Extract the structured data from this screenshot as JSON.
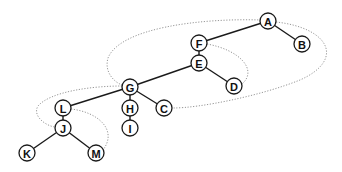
{
  "diagram": {
    "type": "tree",
    "node_radius": 8,
    "colors": {
      "edge": "#1a1a1a",
      "thread": "#8a8a8a",
      "node_fill": "#ffffff",
      "node_stroke": "#1a1a1a",
      "label": "#111111"
    },
    "nodes": [
      {
        "id": "A",
        "label": "A",
        "x": 268,
        "y": 21
      },
      {
        "id": "B",
        "label": "B",
        "x": 302,
        "y": 44
      },
      {
        "id": "F",
        "label": "F",
        "x": 199,
        "y": 43
      },
      {
        "id": "E",
        "label": "E",
        "x": 199,
        "y": 63
      },
      {
        "id": "D",
        "label": "D",
        "x": 234,
        "y": 86
      },
      {
        "id": "G",
        "label": "G",
        "x": 130,
        "y": 87
      },
      {
        "id": "H",
        "label": "H",
        "x": 130,
        "y": 108
      },
      {
        "id": "I",
        "label": "I",
        "x": 130,
        "y": 128
      },
      {
        "id": "C",
        "label": "C",
        "x": 164,
        "y": 108
      },
      {
        "id": "L",
        "label": "L",
        "x": 63,
        "y": 108
      },
      {
        "id": "J",
        "label": "J",
        "x": 63,
        "y": 128
      },
      {
        "id": "K",
        "label": "K",
        "x": 27,
        "y": 153
      },
      {
        "id": "M",
        "label": "M",
        "x": 96,
        "y": 153
      }
    ],
    "edges": [
      [
        "A",
        "F"
      ],
      [
        "A",
        "B"
      ],
      [
        "F",
        "E"
      ],
      [
        "E",
        "G"
      ],
      [
        "E",
        "D"
      ],
      [
        "G",
        "L"
      ],
      [
        "G",
        "H"
      ],
      [
        "G",
        "C"
      ],
      [
        "H",
        "I"
      ],
      [
        "L",
        "J"
      ],
      [
        "J",
        "K"
      ],
      [
        "J",
        "M"
      ]
    ],
    "threads": [
      {
        "id": "outer-loop",
        "from": "A",
        "to": "C",
        "via": [
          "G"
        ],
        "path": "M 261 20 C 200 18, 120 28, 108 58 C 104 72, 114 82, 122 85 M 276 22 C 330 28, 345 60, 300 80 C 260 96, 200 108, 173 108"
      },
      {
        "id": "f-d-loop",
        "from": "F",
        "to": "D",
        "path": "M 207 44 C 240 50, 258 70, 242 84"
      },
      {
        "id": "g-j-loop",
        "from": "G",
        "to": "J",
        "path": "M 122 86 C 90 86, 50 92, 38 106 C 32 116, 46 126, 55 127"
      },
      {
        "id": "l-m-loop",
        "from": "L",
        "to": "M",
        "path": "M 71 109 C 98 112, 118 130, 103 150"
      }
    ]
  }
}
